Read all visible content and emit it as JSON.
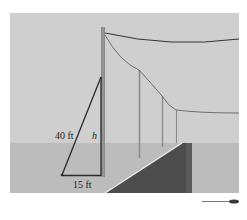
{
  "figure": {
    "labels": {
      "ladder_length": "40 ft",
      "height": "h",
      "base_distance": "15 ft"
    },
    "colors": {
      "sky": "#cfcfcf",
      "ground": "#bdbdbd",
      "road": "#4a4a4a",
      "road_edge": "#e8e8e8",
      "pole": "#8a8a8a",
      "triangle": "#2a2a2a",
      "wire": "#3a3a3a",
      "background": "#ffffff"
    },
    "scene": {
      "main_pole": {
        "description": "utility pole with ladder leaning against it"
      },
      "distant_poles_count": 3,
      "wires_count": 2
    },
    "triangle": {
      "hypotenuse": "40 ft",
      "base": "15 ft",
      "vertical_side": "h"
    }
  }
}
